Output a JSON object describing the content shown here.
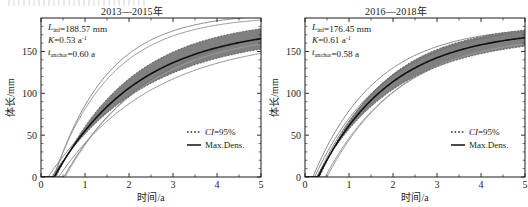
{
  "figure": {
    "width": 528,
    "height": 207,
    "background": "#ffffff",
    "panel_count": 2
  },
  "chart_data": [
    {
      "type": "line",
      "title": "2013—2015年",
      "xlabel": "时间/a",
      "ylabel": "体长/mm",
      "xlim": [
        0,
        5
      ],
      "ylim": [
        0,
        190
      ],
      "xticks": [
        0,
        1,
        2,
        3,
        4,
        5
      ],
      "xtick_labels": [
        "0",
        "1",
        "2",
        "3",
        "4",
        "5"
      ],
      "yticks": [
        0,
        50,
        100,
        150
      ],
      "ytick_labels": [
        "0",
        "50",
        "100",
        "150"
      ],
      "grid": false,
      "legend_position": "lower-right",
      "legend": [
        {
          "label": "CI=95%",
          "style": "dotted",
          "color": "#2b2b2b"
        },
        {
          "label": "Max.Dens.",
          "style": "solid",
          "color": "#111111"
        }
      ],
      "annotations": [
        {
          "symbol": "L",
          "sub": "inf",
          "sep": "=",
          "value": "188.57",
          "unit": "mm",
          "sup": ""
        },
        {
          "symbol": "K",
          "sub": "",
          "sep": "=",
          "value": "0.53",
          "unit": "a",
          "sup": "-1"
        },
        {
          "symbol": "t",
          "sub": "anchor",
          "sep": "=",
          "value": "0.60",
          "unit": "a",
          "sup": ""
        }
      ],
      "model": {
        "form": "von-Bertalanffy",
        "equation": "L(t) = Linf * (1 - exp(-K*(t - t0)))",
        "Linf": 188.57,
        "K": 0.53,
        "t_anchor": 0.6
      },
      "series": [
        {
          "name": "Max.Dens.",
          "role": "median",
          "color": "#111111",
          "width": 1.6,
          "Linf": 181.0,
          "K": 0.52,
          "t0": 0.3
        },
        {
          "name": "CI upper",
          "role": "ci-upper",
          "color": "#4a4a4a",
          "width": 0.8,
          "Linf": 190.0,
          "K": 0.58,
          "t0": 0.34
        },
        {
          "name": "CI lower",
          "role": "ci-lower",
          "color": "#4a4a4a",
          "width": 0.8,
          "Linf": 171.0,
          "K": 0.47,
          "t0": 0.24
        },
        {
          "name": "posterior draw 1",
          "role": "draw",
          "color": "#8a8a8a",
          "width": 1.0,
          "Linf": 196.0,
          "K": 0.82,
          "t0": 0.3
        },
        {
          "name": "posterior draw 2",
          "role": "draw",
          "color": "#9a9a9a",
          "width": 1.0,
          "Linf": 193.0,
          "K": 0.76,
          "t0": 0.28
        },
        {
          "name": "posterior draw 3",
          "role": "draw",
          "color": "#7e7e7e",
          "width": 0.9,
          "Linf": 176.0,
          "K": 0.44,
          "t0": 0.16
        },
        {
          "name": "posterior draw 4",
          "role": "draw",
          "color": "#888888",
          "width": 0.9,
          "Linf": 168.0,
          "K": 0.46,
          "t0": 0.4
        },
        {
          "name": "posterior draw 5",
          "role": "draw",
          "color": "#6f6f6f",
          "width": 0.9,
          "Linf": 185.0,
          "K": 0.5,
          "t0": 0.52
        },
        {
          "name": "posterior draw 6",
          "role": "draw",
          "color": "#9f9f9f",
          "width": 0.9,
          "Linf": 174.0,
          "K": 0.55,
          "t0": 0.55
        }
      ],
      "band": {
        "name": "95% credible band",
        "fill": "#4f4f4f",
        "opacity": 0.72,
        "upper": {
          "Linf": 190.0,
          "K": 0.58,
          "t0": 0.34
        },
        "lower": {
          "Linf": 171.0,
          "K": 0.47,
          "t0": 0.24
        }
      }
    },
    {
      "type": "line",
      "title": "2016—2018年",
      "xlabel": "时间/a",
      "ylabel": "体长/mm",
      "xlim": [
        0,
        5
      ],
      "ylim": [
        0,
        190
      ],
      "xticks": [
        0,
        1,
        2,
        3,
        4,
        5
      ],
      "xtick_labels": [
        "0",
        "1",
        "2",
        "3",
        "4",
        "5"
      ],
      "yticks": [
        0,
        50,
        100,
        150
      ],
      "ytick_labels": [
        "0",
        "50",
        "100",
        "150"
      ],
      "grid": false,
      "legend_position": "lower-right",
      "legend": [
        {
          "label": "CI=95%",
          "style": "dotted",
          "color": "#2b2b2b"
        },
        {
          "label": "Max.Dens.",
          "style": "solid",
          "color": "#111111"
        }
      ],
      "annotations": [
        {
          "symbol": "L",
          "sub": "inf",
          "sep": "=",
          "value": "176.45",
          "unit": "mm",
          "sup": ""
        },
        {
          "symbol": "K",
          "sub": "",
          "sep": "=",
          "value": "0.61",
          "unit": "a",
          "sup": "-1"
        },
        {
          "symbol": "t",
          "sub": "anchor",
          "sep": "=",
          "value": "0.58",
          "unit": "a",
          "sup": ""
        }
      ],
      "model": {
        "form": "von-Bertalanffy",
        "equation": "L(t) = Linf * (1 - exp(-K*(t - t0)))",
        "Linf": 176.45,
        "K": 0.61,
        "t_anchor": 0.58
      },
      "series": [
        {
          "name": "Max.Dens.",
          "role": "median",
          "color": "#111111",
          "width": 1.6,
          "Linf": 176.45,
          "K": 0.61,
          "t0": 0.3
        },
        {
          "name": "CI upper",
          "role": "ci-upper",
          "color": "#4a4a4a",
          "width": 0.8,
          "Linf": 184.0,
          "K": 0.66,
          "t0": 0.33
        },
        {
          "name": "CI lower",
          "role": "ci-lower",
          "color": "#4a4a4a",
          "width": 0.8,
          "Linf": 168.0,
          "K": 0.56,
          "t0": 0.26
        },
        {
          "name": "posterior draw 1",
          "role": "draw",
          "color": "#8a8a8a",
          "width": 1.0,
          "Linf": 181.0,
          "K": 0.7,
          "t0": 0.18
        },
        {
          "name": "posterior draw 2",
          "role": "draw",
          "color": "#9a9a9a",
          "width": 1.0,
          "Linf": 172.0,
          "K": 0.58,
          "t0": 0.46
        },
        {
          "name": "posterior draw 3",
          "role": "draw",
          "color": "#7e7e7e",
          "width": 0.9,
          "Linf": 178.0,
          "K": 0.64,
          "t0": 0.22
        },
        {
          "name": "posterior draw 4",
          "role": "draw",
          "color": "#909090",
          "width": 0.9,
          "Linf": 170.0,
          "K": 0.6,
          "t0": 0.5
        },
        {
          "name": "posterior draw 5",
          "role": "draw",
          "color": "#6f6f6f",
          "width": 0.9,
          "Linf": 183.0,
          "K": 0.63,
          "t0": 0.28
        }
      ],
      "band": {
        "name": "95% credible band",
        "fill": "#4f4f4f",
        "opacity": 0.72,
        "upper": {
          "Linf": 184.0,
          "K": 0.66,
          "t0": 0.33
        },
        "lower": {
          "Linf": 168.0,
          "K": 0.56,
          "t0": 0.26
        }
      }
    }
  ]
}
